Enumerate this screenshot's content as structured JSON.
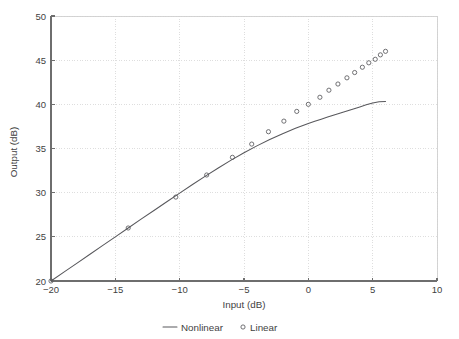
{
  "chart_data": {
    "type": "line",
    "title": "",
    "xlabel": "Input (dB)",
    "ylabel": "Output (dB)",
    "xlim": [
      -20,
      10
    ],
    "ylim": [
      20,
      50
    ],
    "xticks": [
      -20,
      -15,
      -10,
      -5,
      0,
      5,
      10
    ],
    "xtick_labels": [
      "−20",
      "−15",
      "−10",
      "−5",
      "0",
      "5",
      "10"
    ],
    "yticks": [
      20,
      25,
      30,
      35,
      40,
      45,
      50
    ],
    "ytick_labels": [
      "20",
      "25",
      "30",
      "35",
      "40",
      "45",
      "50"
    ],
    "grid": true,
    "legend_position": "below",
    "series": [
      {
        "name": "Nonlinear",
        "style": "line",
        "marker": "none",
        "color": "#58585c",
        "x": [
          -20,
          -19,
          -18,
          -17,
          -16,
          -15,
          -14,
          -13,
          -12,
          -11,
          -10,
          -9,
          -8,
          -7,
          -6,
          -5,
          -4,
          -3,
          -2,
          -1,
          0,
          0.5,
          1,
          1.5,
          2,
          2.5,
          3,
          3.5,
          4,
          4.5,
          5,
          5.5,
          6
        ],
        "y": [
          20.0,
          21.0,
          22.0,
          23.0,
          24.0,
          25.0,
          26.0,
          27.0,
          27.98,
          28.97,
          29.95,
          30.92,
          31.87,
          32.79,
          33.68,
          34.52,
          35.3,
          36.02,
          36.68,
          37.28,
          37.83,
          38.08,
          38.32,
          38.56,
          38.79,
          39.02,
          39.25,
          39.48,
          39.71,
          39.94,
          40.16,
          40.3,
          40.32
        ]
      },
      {
        "name": "Linear",
        "style": "markers",
        "marker": "circle",
        "color": "#58585c",
        "x": [
          -20,
          -14,
          -10.3,
          -7.9,
          -5.9,
          -4.4,
          -3.1,
          -1.9,
          -0.9,
          0.0,
          0.9,
          1.6,
          2.3,
          3.0,
          3.6,
          4.2,
          4.7,
          5.2,
          5.6,
          6.0
        ],
        "y": [
          20.0,
          26.0,
          29.5,
          32.0,
          34.0,
          35.5,
          36.9,
          38.1,
          39.2,
          40.0,
          40.8,
          41.6,
          42.3,
          43.0,
          43.6,
          44.2,
          44.7,
          45.1,
          45.6,
          46.0
        ]
      }
    ],
    "legend": [
      {
        "label": "Nonlinear",
        "glyph": "line"
      },
      {
        "label": "Linear",
        "glyph": "circle"
      }
    ]
  },
  "colors": {
    "series": "#58585c",
    "axis": "#6e6e6e",
    "grid": "#d8d8d8",
    "background": "#ffffff"
  }
}
